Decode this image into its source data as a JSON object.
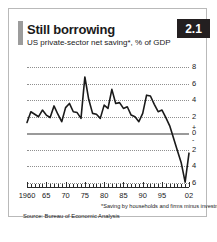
{
  "card": {
    "title": "Still borrowing",
    "subtitle": "US private-sector net saving*, % of GDP",
    "badge": "2.1",
    "footnote": "*Saving by households and firms minus investment",
    "source": "Source: Bureau of Economic Analysis",
    "accent_color": "#9c9c9c",
    "badge_bg": "#231f20",
    "badge_fg": "#ffffff",
    "line_color": "#1a1a1a",
    "grid_color": "#8f8f8f",
    "zero_line_color": "#9a9a9a"
  },
  "chart_data": {
    "type": "line",
    "title": "Still borrowing",
    "subtitle": "US private-sector net saving*, % of GDP",
    "xlabel": "",
    "ylabel": "% of GDP",
    "ylim": [
      -6,
      8
    ],
    "xlim": [
      1960,
      2002
    ],
    "grid": true,
    "legend": false,
    "y_ticks": [
      8,
      6,
      4,
      2,
      0,
      -2,
      -4,
      -6
    ],
    "y_tick_labels": [
      "8",
      "6",
      "4",
      "2",
      "0",
      "2",
      "4",
      "6"
    ],
    "y_sign_plus": "+",
    "y_sign_minus": "-",
    "zero_line": 0,
    "x_ticks": [
      1960,
      1965,
      1970,
      1975,
      1980,
      1985,
      1990,
      1995,
      2002
    ],
    "x_tick_labels": [
      "1960",
      "65",
      "70",
      "75",
      "80",
      "85",
      "90",
      "95",
      "02"
    ],
    "series": [
      {
        "name": "US private-sector net saving",
        "color": "#1a1a1a",
        "x": [
          1960,
          1961,
          1962,
          1963,
          1964,
          1965,
          1966,
          1967,
          1968,
          1969,
          1970,
          1971,
          1972,
          1973,
          1974,
          1975,
          1976,
          1977,
          1978,
          1979,
          1980,
          1981,
          1982,
          1983,
          1984,
          1985,
          1986,
          1987,
          1988,
          1989,
          1990,
          1991,
          1992,
          1993,
          1994,
          1995,
          1996,
          1997,
          1998,
          1999,
          2000,
          2001,
          2002
        ],
        "values": [
          1.3,
          2.6,
          2.3,
          2.0,
          2.8,
          2.2,
          1.9,
          3.3,
          2.3,
          1.4,
          3.1,
          3.6,
          2.6,
          2.5,
          1.8,
          6.8,
          4.1,
          2.4,
          2.3,
          1.8,
          3.4,
          3.0,
          5.3,
          3.6,
          3.7,
          3.0,
          3.2,
          2.2,
          2.0,
          1.4,
          2.4,
          4.6,
          4.5,
          3.5,
          2.6,
          2.8,
          1.9,
          0.9,
          -0.6,
          -2.1,
          -3.6,
          -5.9,
          -2.4
        ]
      }
    ]
  }
}
